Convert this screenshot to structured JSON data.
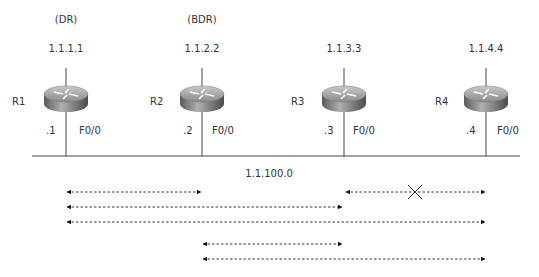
{
  "diagram": {
    "network_label": "1.1.100.0",
    "routers": [
      {
        "name": "R1",
        "role": "(DR)",
        "router_id": "1.1.1.1",
        "host": ".1",
        "interface": "F0/0",
        "x": 66
      },
      {
        "name": "R2",
        "role": "(BDR)",
        "router_id": "1.1.2.2",
        "host": ".2",
        "interface": "F0/0",
        "x": 202
      },
      {
        "name": "R3",
        "role": "",
        "router_id": "1.1.3.3",
        "host": ".3",
        "interface": "F0/0",
        "x": 344
      },
      {
        "name": "R4",
        "role": "",
        "router_id": "1.1.4.4",
        "host": ".4",
        "interface": "F0/0",
        "x": 486
      }
    ],
    "adjacencies": [
      {
        "from": "R1",
        "to": "R2",
        "status": "full"
      },
      {
        "from": "R3",
        "to": "R4",
        "status": "blocked",
        "marker": "X"
      },
      {
        "from": "R1",
        "to": "R3",
        "status": "full"
      },
      {
        "from": "R1",
        "to": "R4",
        "status": "full"
      },
      {
        "from": "R2",
        "to": "R3",
        "status": "full"
      },
      {
        "from": "R2",
        "to": "R4",
        "status": "full"
      }
    ]
  }
}
